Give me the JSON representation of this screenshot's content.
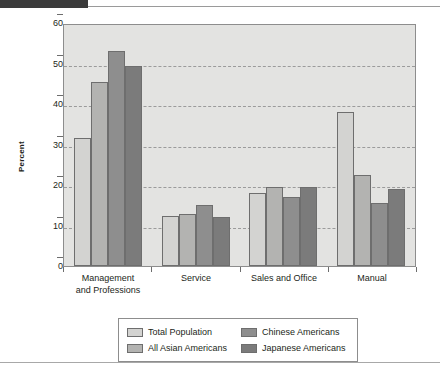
{
  "decor": {
    "top_block_color": "#3b3b3b",
    "rule_color": "#a8a8a8"
  },
  "chart_data": {
    "type": "bar",
    "title": "",
    "xlabel": "",
    "ylabel": "Percent",
    "ylim": [
      0,
      60
    ],
    "yticks": [
      0,
      10,
      20,
      30,
      40,
      50,
      60
    ],
    "grid": true,
    "legend_position": "bottom",
    "categories": [
      "Management\nand Professions",
      "Service",
      "Sales and Office",
      "Manual"
    ],
    "category_lines": [
      [
        "Management",
        "and Professions"
      ],
      [
        "Service"
      ],
      [
        "Sales and Office"
      ],
      [
        "Manual"
      ]
    ],
    "series": [
      {
        "name": "Total Population",
        "color": "#d3d3d1",
        "values": [
          31.5,
          12.3,
          18.0,
          38.0
        ]
      },
      {
        "name": "All Asian Americans",
        "color": "#b3b3b1",
        "values": [
          45.5,
          12.8,
          19.5,
          22.5
        ]
      },
      {
        "name": "Chinese Americans",
        "color": "#8e8e8e",
        "values": [
          53.0,
          15.0,
          17.0,
          15.5
        ]
      },
      {
        "name": "Japanese Americans",
        "color": "#7b7b7b",
        "values": [
          49.5,
          12.2,
          19.5,
          19.0
        ]
      }
    ],
    "legend_order": [
      "Total Population",
      "Chinese Americans",
      "All Asian Americans",
      "Japanese Americans"
    ]
  }
}
